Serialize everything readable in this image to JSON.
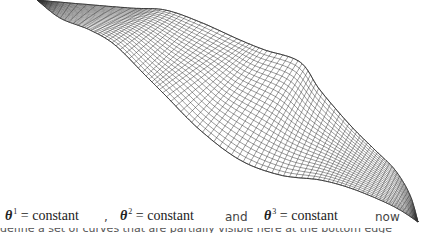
{
  "figure": {
    "line_color": "#333333",
    "background": "#ffffff"
  },
  "caption": {
    "eq1": {
      "symbol": "θ",
      "index": "1",
      "rest": "= constant"
    },
    "sep1": ",",
    "eq2": {
      "symbol": "θ",
      "index": "2",
      "rest": "= constant"
    },
    "and": "and",
    "eq3": {
      "symbol": "θ",
      "index": "3",
      "rest": "= constant"
    },
    "now": "now",
    "cut_line": "define a set of curves ... partially visible"
  }
}
